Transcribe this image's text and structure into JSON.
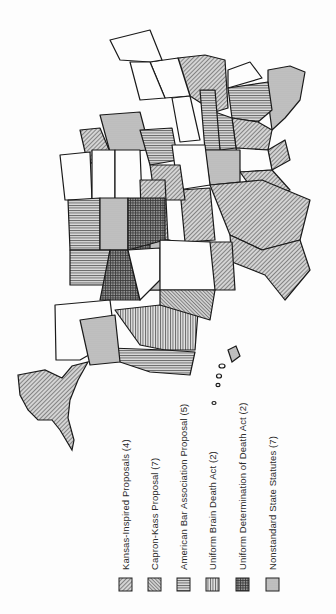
{
  "map": {
    "title": "",
    "orientation": "rotated 90° clockwise (north points right)",
    "region": "United States",
    "legend": [
      {
        "label": "Kansas-Inspired Proposals (4)",
        "count": 4,
        "pattern": "diagonal-right",
        "swatch_x": 126
      },
      {
        "label": "Capron-Kass Proposal (7)",
        "count": 7,
        "pattern": "diagonal-left-dense",
        "swatch_x": 154
      },
      {
        "label": "American Bar Association Proposal (5)",
        "count": 5,
        "pattern": "horizontal-lines",
        "swatch_x": 183
      },
      {
        "label": "Uniform Brain Death Act (2)",
        "count": 2,
        "pattern": "vertical-lines",
        "swatch_x": 212
      },
      {
        "label": "Uniform Determination of Death Act (2)",
        "count": 2,
        "pattern": "dark-grid",
        "swatch_x": 241
      },
      {
        "label": "Nonstandard State Statutes (7)",
        "count": 7,
        "pattern": "light-dots",
        "swatch_x": 271
      }
    ],
    "colors": {
      "outline": "#1a1a1a",
      "fill_gray": "#bdbdbd",
      "fill_dark": "#8a8a8a",
      "background": "#fdfdfd"
    }
  }
}
